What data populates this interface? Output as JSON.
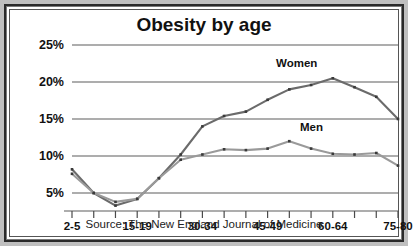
{
  "chart_data": {
    "type": "line",
    "title": "Obesity by age",
    "xlabel": "",
    "ylabel": "",
    "ylim": [
      0,
      26
    ],
    "yticks": [
      5,
      10,
      15,
      20,
      25
    ],
    "ytick_labels": [
      "5%",
      "10%",
      "15%",
      "20%",
      "25%"
    ],
    "grid": true,
    "legend_position": "inline-annotation",
    "source_note": "Source: The New England Journal of Medicine",
    "x": [
      "2-5",
      "6-9",
      "10-14",
      "15-19",
      "20-24",
      "25-29",
      "30-34",
      "35-39",
      "40-44",
      "45-49",
      "50-54",
      "55-59",
      "60-64",
      "65-69",
      "70-74",
      "75-80"
    ],
    "xtick_labels": [
      "2-5",
      "15-19",
      "30-34",
      "45-49",
      "60-64",
      "75-80"
    ],
    "xtick_label_indices": [
      0,
      3,
      6,
      9,
      12,
      15
    ],
    "series": [
      {
        "name": "Women",
        "color": "#6b6b6b",
        "values": [
          8.2,
          5.0,
          3.3,
          4.2,
          7.0,
          10.2,
          14.0,
          15.4,
          16.0,
          17.6,
          19.0,
          19.6,
          20.5,
          19.3,
          18.0,
          15.0
        ]
      },
      {
        "name": "Men",
        "color": "#9a9a9a",
        "values": [
          7.6,
          5.0,
          3.8,
          4.2,
          7.0,
          9.5,
          10.2,
          10.9,
          10.8,
          11.0,
          12.0,
          11.0,
          10.3,
          10.2,
          10.4,
          8.7
        ]
      }
    ]
  },
  "annotations": {
    "women_label": "Women",
    "men_label": "Men"
  }
}
